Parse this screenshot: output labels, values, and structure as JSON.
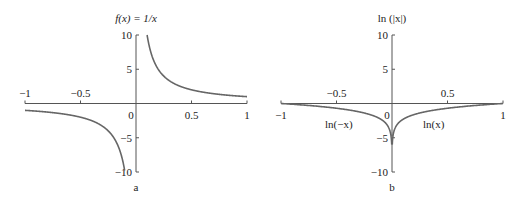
{
  "chart_data": [
    {
      "type": "line",
      "panel": "a",
      "title": "f(x) = 1/x",
      "xlabel": "",
      "ylabel": "",
      "xlim": [
        -1,
        1
      ],
      "ylim": [
        -10,
        10
      ],
      "grid": false,
      "x_ticks": [
        {
          "value": -1,
          "label": "−1"
        },
        {
          "value": -0.5,
          "label": "−0.5"
        },
        {
          "value": 0,
          "label": "0"
        },
        {
          "value": 0.5,
          "label": "0.5"
        },
        {
          "value": 1,
          "label": "1"
        }
      ],
      "y_ticks": [
        {
          "value": 10,
          "label": "10"
        },
        {
          "value": 5,
          "label": "5"
        },
        {
          "value": -5,
          "label": "−5"
        },
        {
          "value": -10,
          "label": "−10"
        }
      ],
      "series": [
        {
          "name": "1/x (x<0)",
          "function": "1/x",
          "domain": [
            -1,
            -0.1
          ]
        },
        {
          "name": "1/x (x>0)",
          "function": "1/x",
          "domain": [
            0.1,
            1
          ]
        }
      ],
      "annotations": []
    },
    {
      "type": "line",
      "panel": "b",
      "title": "ln (|x|)",
      "xlabel": "",
      "ylabel": "",
      "xlim": [
        -1,
        1
      ],
      "ylim": [
        -10,
        10
      ],
      "grid": false,
      "x_ticks": [
        {
          "value": -1,
          "label": "−1"
        },
        {
          "value": -0.5,
          "label": "−0.5"
        },
        {
          "value": 0,
          "label": "0"
        },
        {
          "value": 0.5,
          "label": "0.5"
        },
        {
          "value": 1,
          "label": "1"
        }
      ],
      "y_ticks": [
        {
          "value": 10,
          "label": "10"
        },
        {
          "value": 5,
          "label": "5"
        },
        {
          "value": -5,
          "label": "−5"
        },
        {
          "value": -10,
          "label": "−10"
        }
      ],
      "series": [
        {
          "name": "ln(−x)",
          "function": "ln(-x)",
          "domain": [
            -1,
            -0.0025
          ]
        },
        {
          "name": "ln(x)",
          "function": "ln(x)",
          "domain": [
            0.0025,
            1
          ]
        }
      ],
      "annotations": [
        {
          "text": "ln(−x)",
          "near_x": -0.4,
          "near_y": -3
        },
        {
          "text": "ln(x)",
          "near_x": 0.3,
          "near_y": -3
        }
      ]
    }
  ],
  "panel_labels": [
    "a",
    "b"
  ]
}
